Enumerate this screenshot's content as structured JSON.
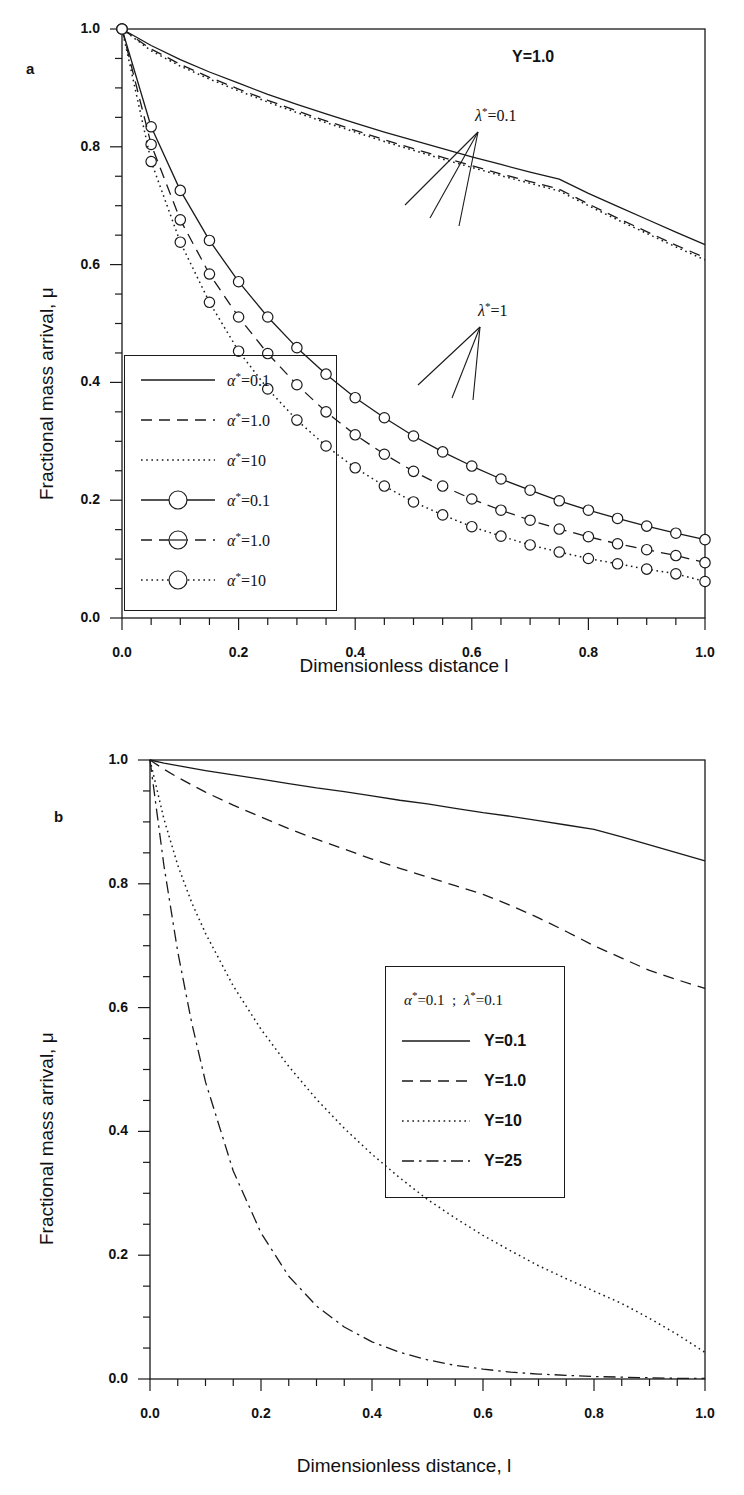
{
  "figure": {
    "panels": [
      {
        "letter": "a",
        "annotations": [
          {
            "name": "y-parameter",
            "text": "Y=1.0"
          },
          {
            "name": "lambda-0p1",
            "text": "λ*=0.1"
          },
          {
            "name": "lambda-1",
            "text": "λ*=1"
          }
        ],
        "chart_data": {
          "type": "line",
          "title": "",
          "xlabel": "Dimensionless distance l",
          "ylabel": "Fractional mass arrival, μ",
          "xlim": [
            0.0,
            1.0
          ],
          "ylim": [
            0.0,
            1.0
          ],
          "xticks": [
            "0.0",
            "0.2",
            "0.4",
            "0.6",
            "0.8",
            "1.0"
          ],
          "yticks": [
            "0.0",
            "0.2",
            "0.4",
            "0.6",
            "0.8",
            "1.0"
          ],
          "xtick_values": [
            0.0,
            0.2,
            0.4,
            0.6,
            0.8,
            1.0
          ],
          "ytick_values": [
            0.0,
            0.2,
            0.4,
            0.6,
            0.8,
            1.0
          ],
          "minor_tick_step": 0.05,
          "grid": false,
          "legend_position": "lower-left",
          "x": [
            0.0,
            0.05,
            0.1,
            0.15,
            0.2,
            0.25,
            0.3,
            0.35,
            0.4,
            0.45,
            0.5,
            0.55,
            0.6,
            0.65,
            0.7,
            0.75,
            0.8,
            0.85,
            0.9,
            0.95,
            1.0
          ],
          "series": [
            {
              "name": "α*=0.1",
              "group": "λ*=0.1",
              "style": "solid",
              "markers": false,
              "values": [
                1.0,
                0.972,
                0.948,
                0.927,
                0.908,
                0.889,
                0.872,
                0.856,
                0.84,
                0.825,
                0.811,
                0.797,
                0.783,
                0.77,
                0.757,
                0.745,
                0.721,
                0.699,
                0.677,
                0.655,
                0.634
              ]
            },
            {
              "name": "α*=1.0",
              "group": "λ*=0.1",
              "style": "dashed",
              "markers": false,
              "values": [
                1.0,
                0.966,
                0.94,
                0.918,
                0.898,
                0.879,
                0.861,
                0.844,
                0.828,
                0.812,
                0.797,
                0.782,
                0.768,
                0.754,
                0.741,
                0.728,
                0.703,
                0.679,
                0.656,
                0.633,
                0.612
              ]
            },
            {
              "name": "α*=10",
              "group": "λ*=0.1",
              "style": "dotted",
              "markers": false,
              "values": [
                1.0,
                0.963,
                0.937,
                0.915,
                0.895,
                0.876,
                0.858,
                0.841,
                0.825,
                0.809,
                0.794,
                0.779,
                0.765,
                0.751,
                0.738,
                0.725,
                0.7,
                0.676,
                0.653,
                0.63,
                0.608
              ]
            },
            {
              "name": "α*=0.1",
              "group": "λ*=1",
              "style": "solid",
              "markers": true,
              "values": [
                1.0,
                0.834,
                0.726,
                0.641,
                0.571,
                0.511,
                0.459,
                0.414,
                0.374,
                0.34,
                0.309,
                0.282,
                0.258,
                0.236,
                0.217,
                0.199,
                0.183,
                0.169,
                0.156,
                0.144,
                0.133
              ]
            },
            {
              "name": "α*=1.0",
              "group": "λ*=1",
              "style": "dashed",
              "markers": true,
              "values": [
                1.0,
                0.804,
                0.676,
                0.584,
                0.511,
                0.449,
                0.396,
                0.35,
                0.311,
                0.278,
                0.249,
                0.224,
                0.202,
                0.183,
                0.166,
                0.151,
                0.138,
                0.126,
                0.116,
                0.106,
                0.094
              ]
            },
            {
              "name": "α*=10",
              "group": "λ*=1",
              "style": "dotted",
              "markers": true,
              "values": [
                1.0,
                0.775,
                0.638,
                0.536,
                0.453,
                0.389,
                0.336,
                0.292,
                0.255,
                0.224,
                0.197,
                0.175,
                0.155,
                0.139,
                0.124,
                0.112,
                0.101,
                0.092,
                0.083,
                0.075,
                0.062
              ]
            }
          ],
          "legend": [
            {
              "label": "α*=0.1",
              "style": "solid",
              "markers": false
            },
            {
              "label": "α*=1.0",
              "style": "dashed",
              "markers": false
            },
            {
              "label": "α*=10",
              "style": "dotted",
              "markers": false
            },
            {
              "label": "α*=0.1",
              "style": "solid",
              "markers": true
            },
            {
              "label": "α*=1.0",
              "style": "dashed",
              "markers": true
            },
            {
              "label": "α*=10",
              "style": "dotted",
              "markers": true
            }
          ]
        }
      },
      {
        "letter": "b",
        "annotations": [],
        "chart_data": {
          "type": "line",
          "title": "",
          "xlabel": "Dimensionless distance, l",
          "ylabel": "Fractional mass arrival, μ",
          "xlim": [
            0.0,
            1.0
          ],
          "ylim": [
            0.0,
            1.0
          ],
          "xticks": [
            "0.0",
            "0.2",
            "0.4",
            "0.6",
            "0.8",
            "1.0"
          ],
          "yticks": [
            "0.0",
            "0.2",
            "0.4",
            "0.6",
            "0.8",
            "1.0"
          ],
          "xtick_values": [
            0.0,
            0.2,
            0.4,
            0.6,
            0.8,
            1.0
          ],
          "ytick_values": [
            0.0,
            0.2,
            0.4,
            0.6,
            0.8,
            1.0
          ],
          "minor_tick_step": 0.05,
          "grid": false,
          "legend_position": "center-right",
          "legend_header": "α*=0.1  ;  λ*=0.1",
          "x": [
            0.0,
            0.025,
            0.05,
            0.075,
            0.1,
            0.15,
            0.2,
            0.25,
            0.3,
            0.35,
            0.4,
            0.45,
            0.5,
            0.55,
            0.6,
            0.65,
            0.7,
            0.75,
            0.8,
            0.85,
            0.9,
            0.95,
            1.0
          ],
          "series": [
            {
              "name": "Y=0.1",
              "style": "solid",
              "values": [
                1.0,
                0.995,
                0.991,
                0.987,
                0.983,
                0.976,
                0.969,
                0.962,
                0.955,
                0.949,
                0.942,
                0.935,
                0.929,
                0.922,
                0.915,
                0.909,
                0.902,
                0.895,
                0.888,
                0.876,
                0.863,
                0.85,
                0.837
              ]
            },
            {
              "name": "Y=1.0",
              "style": "dashed",
              "values": [
                1.0,
                0.985,
                0.972,
                0.96,
                0.948,
                0.927,
                0.908,
                0.889,
                0.872,
                0.856,
                0.84,
                0.825,
                0.811,
                0.797,
                0.783,
                0.765,
                0.745,
                0.723,
                0.7,
                0.68,
                0.66,
                0.645,
                0.631
              ]
            },
            {
              "name": "Y=10",
              "style": "dotted",
              "values": [
                1.0,
                0.905,
                0.83,
                0.77,
                0.72,
                0.635,
                0.565,
                0.505,
                0.452,
                0.405,
                0.363,
                0.325,
                0.29,
                0.26,
                0.232,
                0.207,
                0.183,
                0.162,
                0.142,
                0.122,
                0.098,
                0.072,
                0.043
              ]
            },
            {
              "name": "Y=25",
              "style": "dashdot",
              "values": [
                1.0,
                0.83,
                0.69,
                0.576,
                0.48,
                0.336,
                0.236,
                0.166,
                0.118,
                0.084,
                0.06,
                0.043,
                0.031,
                0.022,
                0.016,
                0.011,
                0.008,
                0.006,
                0.004,
                0.003,
                0.002,
                0.001,
                0.001
              ]
            }
          ],
          "legend": [
            {
              "label": "Y=0.1",
              "style": "solid"
            },
            {
              "label": "Y=1.0",
              "style": "dashed"
            },
            {
              "label": "Y=10",
              "style": "dotted"
            },
            {
              "label": "Y=25",
              "style": "dashdot"
            }
          ]
        }
      }
    ],
    "colors": {
      "line": "#1a1a1a",
      "axis": "#1a1a1a",
      "background": "#ffffff"
    }
  }
}
